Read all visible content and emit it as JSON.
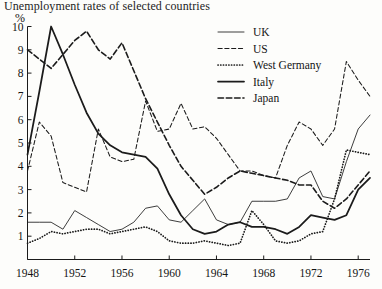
{
  "chart_data": {
    "type": "line",
    "title": "Unemployment rates of selected countries",
    "xlabel": "",
    "ylabel": "%",
    "ylim": [
      0,
      10
    ],
    "xlim": [
      1948,
      1977
    ],
    "grid": false,
    "legend_position": "top-right",
    "y_ticks": [
      "1",
      "2",
      "3",
      "4",
      "5",
      "6",
      "7",
      "8",
      "9",
      "10"
    ],
    "y_tick_values": [
      1,
      2,
      3,
      4,
      5,
      6,
      7,
      8,
      9,
      10
    ],
    "x_ticks": [
      "1948",
      "1952",
      "1956",
      "1960",
      "1964",
      "1968",
      "1972",
      "1976"
    ],
    "x_tick_values": [
      1948,
      1952,
      1956,
      1960,
      1964,
      1968,
      1972,
      1976
    ],
    "x": [
      1948,
      1949,
      1950,
      1951,
      1952,
      1953,
      1954,
      1955,
      1956,
      1957,
      1958,
      1959,
      1960,
      1961,
      1962,
      1963,
      1964,
      1965,
      1966,
      1967,
      1968,
      1969,
      1970,
      1971,
      1972,
      1973,
      1974,
      1975,
      1976,
      1977
    ],
    "series": [
      {
        "name": "UK",
        "style": "solid-thin",
        "values": [
          1.6,
          1.6,
          1.6,
          1.3,
          2.1,
          1.8,
          1.5,
          1.2,
          1.3,
          1.6,
          2.2,
          2.3,
          1.7,
          1.6,
          2.1,
          2.6,
          1.7,
          1.5,
          1.6,
          2.5,
          2.5,
          2.5,
          2.6,
          3.5,
          3.8,
          2.7,
          2.6,
          4.2,
          5.6,
          6.2
        ]
      },
      {
        "name": "US",
        "style": "dashed-short",
        "values": [
          3.8,
          5.9,
          5.3,
          3.3,
          3.1,
          2.9,
          5.6,
          4.4,
          4.2,
          4.3,
          6.8,
          5.5,
          5.6,
          6.7,
          5.6,
          5.7,
          5.2,
          4.5,
          3.8,
          3.8,
          3.6,
          3.5,
          4.9,
          5.9,
          5.6,
          4.9,
          5.6,
          8.5,
          7.7,
          7.0
        ]
      },
      {
        "name": "West Germany",
        "style": "dotted",
        "values": [
          0.7,
          0.9,
          1.2,
          1.1,
          1.2,
          1.3,
          1.3,
          1.1,
          1.2,
          1.3,
          1.4,
          1.2,
          0.8,
          0.7,
          0.7,
          0.8,
          0.7,
          0.6,
          0.7,
          2.1,
          1.5,
          0.8,
          0.7,
          0.8,
          1.1,
          1.2,
          2.6,
          4.7,
          4.6,
          4.5
        ]
      },
      {
        "name": "Italy",
        "style": "solid-thick",
        "values": [
          4.5,
          7.2,
          10.0,
          8.8,
          7.5,
          6.3,
          5.4,
          4.9,
          4.6,
          4.5,
          4.4,
          3.9,
          2.8,
          1.9,
          1.3,
          1.1,
          1.2,
          1.5,
          1.6,
          1.4,
          1.4,
          1.3,
          1.1,
          1.4,
          1.9,
          1.8,
          1.7,
          1.9,
          3.0,
          3.5
        ]
      },
      {
        "name": "Japan",
        "style": "dashed-long",
        "values": [
          9.0,
          8.6,
          8.2,
          8.8,
          9.4,
          9.8,
          9.0,
          8.6,
          9.3,
          8.1,
          6.9,
          5.9,
          4.9,
          4.0,
          3.4,
          2.8,
          3.1,
          3.5,
          3.8,
          3.7,
          3.6,
          3.5,
          3.4,
          3.2,
          3.2,
          2.5,
          2.2,
          2.6,
          3.2,
          3.8
        ]
      }
    ]
  },
  "legend": {
    "items": [
      {
        "label": "UK",
        "style": "solid-thin"
      },
      {
        "label": "US",
        "style": "dashed-short"
      },
      {
        "label": "West Germany",
        "style": "dotted"
      },
      {
        "label": "Italy",
        "style": "solid-thick"
      },
      {
        "label": "Japan",
        "style": "dashed-long"
      }
    ]
  }
}
